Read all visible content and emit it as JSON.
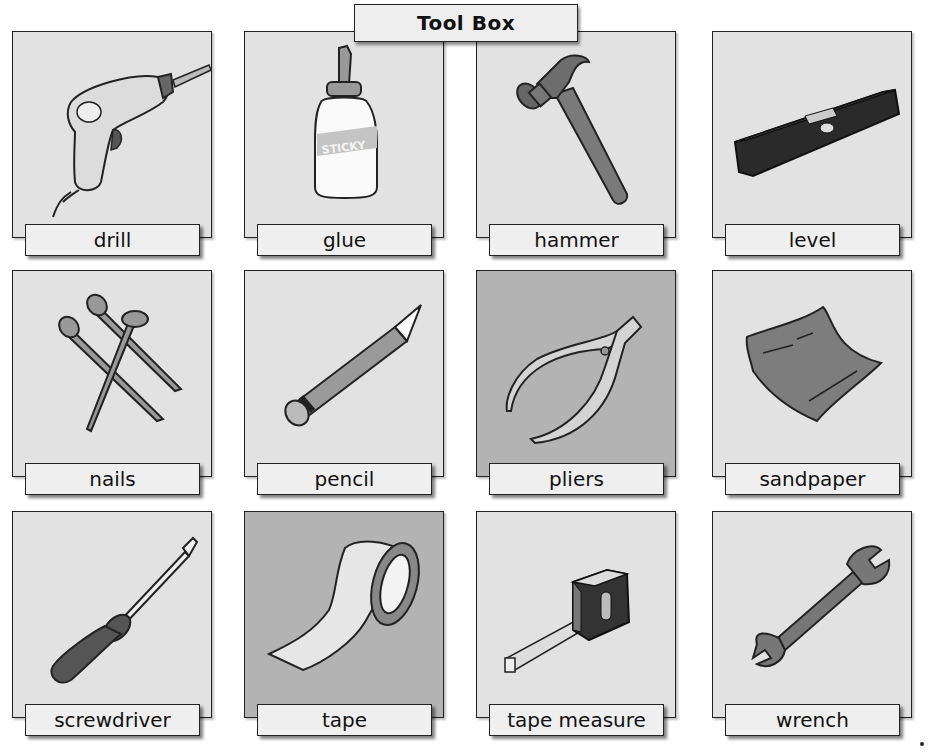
{
  "title": "Tool Box",
  "colors": {
    "panel_light": "#e2e2e2",
    "panel_dark": "#b3b3b3",
    "label_bg": "#efefef",
    "border": "#222222"
  },
  "tools": [
    {
      "label": "drill",
      "icon": "drill-icon",
      "panel": "light"
    },
    {
      "label": "glue",
      "icon": "glue-bottle-icon",
      "panel": "light"
    },
    {
      "label": "hammer",
      "icon": "hammer-icon",
      "panel": "light"
    },
    {
      "label": "level",
      "icon": "spirit-level-icon",
      "panel": "light"
    },
    {
      "label": "nails",
      "icon": "nails-icon",
      "panel": "light"
    },
    {
      "label": "pencil",
      "icon": "pencil-icon",
      "panel": "light"
    },
    {
      "label": "pliers",
      "icon": "pliers-icon",
      "panel": "dark"
    },
    {
      "label": "sandpaper",
      "icon": "sandpaper-icon",
      "panel": "light"
    },
    {
      "label": "screwdriver",
      "icon": "screwdriver-icon",
      "panel": "light"
    },
    {
      "label": "tape",
      "icon": "tape-roll-icon",
      "panel": "dark"
    },
    {
      "label": "tape measure",
      "icon": "tape-measure-icon",
      "panel": "light"
    },
    {
      "label": "wrench",
      "icon": "wrench-icon",
      "panel": "light"
    }
  ],
  "glue_label_text": "STICKY"
}
